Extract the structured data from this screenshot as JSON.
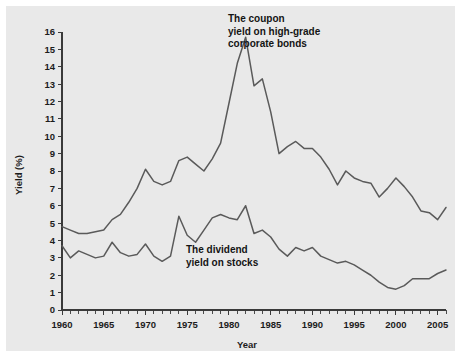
{
  "chart_data": {
    "type": "line",
    "title": "",
    "xlabel": "Year",
    "ylabel": "Yield (%)",
    "xlim": [
      1960,
      2006
    ],
    "ylim": [
      0,
      16
    ],
    "grid": false,
    "legend_position": "inline-annotations",
    "x_tick_labels": [
      "1960",
      "1965",
      "1970",
      "1975",
      "1980",
      "1985",
      "1990",
      "1995",
      "2000",
      "2005"
    ],
    "x_tick_values": [
      1960,
      1965,
      1970,
      1975,
      1980,
      1985,
      1990,
      1995,
      2000,
      2005
    ],
    "x_minor_tick_step": 1,
    "y_tick_labels": [
      "0",
      "1",
      "2",
      "3",
      "4",
      "5",
      "6",
      "7",
      "8",
      "9",
      "10",
      "11",
      "12",
      "13",
      "14",
      "15",
      "16"
    ],
    "y_tick_values": [
      0,
      1,
      2,
      3,
      4,
      5,
      6,
      7,
      8,
      9,
      10,
      11,
      12,
      13,
      14,
      15,
      16
    ],
    "x": [
      1960,
      1961,
      1962,
      1963,
      1964,
      1965,
      1966,
      1967,
      1968,
      1969,
      1970,
      1971,
      1972,
      1973,
      1974,
      1975,
      1976,
      1977,
      1978,
      1979,
      1980,
      1981,
      1982,
      1983,
      1984,
      1985,
      1986,
      1987,
      1988,
      1989,
      1990,
      1991,
      1992,
      1993,
      1994,
      1995,
      1996,
      1997,
      1998,
      1999,
      2000,
      2001,
      2002,
      2003,
      2004,
      2005,
      2006
    ],
    "series": [
      {
        "name": "The coupon yield on high-grade corporate bonds",
        "color": "#5a5a5a",
        "values": [
          4.8,
          4.6,
          4.4,
          4.4,
          4.5,
          4.6,
          5.2,
          5.5,
          6.2,
          7.0,
          8.1,
          7.4,
          7.2,
          7.4,
          8.6,
          8.8,
          8.4,
          8.0,
          8.7,
          9.6,
          11.9,
          14.2,
          15.7,
          12.9,
          13.3,
          11.4,
          9.0,
          9.4,
          9.7,
          9.3,
          9.3,
          8.8,
          8.1,
          7.2,
          8.0,
          7.6,
          7.4,
          7.3,
          6.5,
          7.0,
          7.6,
          7.1,
          6.5,
          5.7,
          5.6,
          5.2,
          5.9
        ]
      },
      {
        "name": "The dividend yield on stocks",
        "color": "#5a5a5a",
        "values": [
          3.7,
          3.0,
          3.4,
          3.2,
          3.0,
          3.1,
          3.9,
          3.3,
          3.1,
          3.2,
          3.8,
          3.1,
          2.8,
          3.1,
          5.4,
          4.3,
          3.9,
          4.6,
          5.3,
          5.5,
          5.3,
          5.2,
          6.0,
          4.4,
          4.6,
          4.2,
          3.5,
          3.1,
          3.6,
          3.4,
          3.6,
          3.1,
          2.9,
          2.7,
          2.8,
          2.6,
          2.3,
          2.0,
          1.6,
          1.3,
          1.2,
          1.4,
          1.8,
          1.8,
          1.8,
          2.1,
          2.3
        ]
      }
    ],
    "annotations": [
      {
        "name": "bond-annotation",
        "lines": [
          "The coupon",
          "yield on high-grade",
          "corporate bonds"
        ],
        "x_px": 228,
        "y_px": 22
      },
      {
        "name": "dividend-annotation",
        "lines": [
          "The dividend",
          "yield on stocks"
        ],
        "x_px": 186,
        "y_px": 253
      }
    ]
  },
  "colors": {
    "plate_background": "#e9e9e9",
    "page_background": "#ffffff",
    "line": "#5a5a5a",
    "axis": "#3a3a3a",
    "text": "#1c1c1c"
  }
}
